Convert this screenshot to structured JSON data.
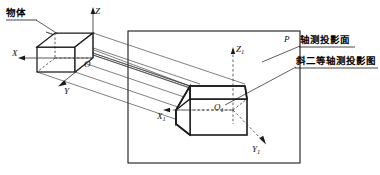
{
  "figure": {
    "type": "technical-drawing",
    "background_color": "#ffffff",
    "line_color": "#1a1a1a",
    "thin_line_color": "#3a3a3a"
  },
  "labels": {
    "object": "物体",
    "projection_plane_cn": "轴测投影面",
    "projection_drawing_cn": "斜二等轴测投影图",
    "plane_letter": "P"
  },
  "axes": {
    "object_origin": "O",
    "object_x": "X",
    "object_y": "Y",
    "object_z": "Z",
    "image_origin": "O",
    "image_origin_sub": "1",
    "image_x": "X",
    "image_x_sub": "1",
    "image_y": "Y",
    "image_y_sub": "1",
    "image_z": "Z",
    "image_z_sub": "1"
  }
}
